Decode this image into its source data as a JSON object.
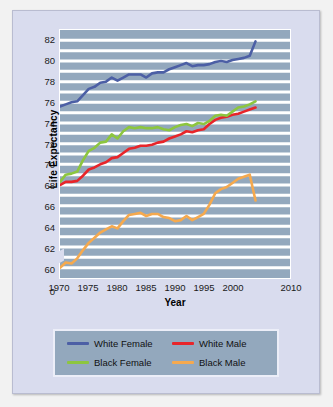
{
  "chart_data": {
    "type": "line",
    "title": "",
    "xlabel": "Year",
    "ylabel": "Life Expectancy",
    "xlim": [
      1970,
      2010
    ],
    "ylim": [
      59,
      83
    ],
    "grid": true,
    "legend_position": "bottom",
    "x_ticks": [
      "1970",
      "1975",
      "1980",
      "1985",
      "1990",
      "1995",
      "2000",
      "2010"
    ],
    "x_tick_values": [
      1970,
      1975,
      1980,
      1985,
      1990,
      1995,
      2000,
      2010
    ],
    "y_ticks": [
      "0",
      "60",
      "62",
      "64",
      "66",
      "68",
      "70",
      "72",
      "74",
      "76",
      "78",
      "80",
      "82"
    ],
    "y_tick_values": [
      59,
      60,
      62,
      64,
      66,
      68,
      70,
      72,
      74,
      76,
      78,
      80,
      82
    ],
    "axis_break_below": 60,
    "x": [
      1970,
      1971,
      1972,
      1973,
      1974,
      1975,
      1976,
      1977,
      1978,
      1979,
      1980,
      1981,
      1982,
      1983,
      1984,
      1985,
      1986,
      1987,
      1988,
      1989,
      1990,
      1991,
      1992,
      1993,
      1994,
      1995,
      1996,
      1997,
      1998,
      1999,
      2000,
      2001,
      2002,
      2003
    ],
    "series": [
      {
        "name": "White Female",
        "color": "#4c5fa5",
        "values": [
          75.6,
          75.8,
          76.0,
          76.1,
          76.7,
          77.3,
          77.5,
          77.9,
          78.0,
          78.4,
          78.1,
          78.4,
          78.7,
          78.7,
          78.7,
          78.4,
          78.8,
          78.9,
          78.9,
          79.2,
          79.4,
          79.6,
          79.8,
          79.5,
          79.6,
          79.6,
          79.7,
          79.9,
          80.0,
          79.9,
          80.1,
          80.2,
          80.3,
          80.5
        ],
        "last_value": 81.9
      },
      {
        "name": "White Male",
        "color": "#e8252a",
        "values": [
          68.0,
          68.3,
          68.3,
          68.4,
          68.9,
          69.5,
          69.7,
          70.0,
          70.2,
          70.6,
          70.7,
          71.1,
          71.5,
          71.6,
          71.8,
          71.8,
          71.9,
          72.1,
          72.2,
          72.5,
          72.7,
          72.9,
          73.2,
          73.1,
          73.3,
          73.4,
          73.9,
          74.3,
          74.5,
          74.6,
          74.8,
          74.9,
          75.1,
          75.3
        ],
        "last_value": 75.5
      },
      {
        "name": "Black Female",
        "color": "#8dc63f",
        "values": [
          68.3,
          69.0,
          69.1,
          69.3,
          70.4,
          71.3,
          71.6,
          72.1,
          72.2,
          72.9,
          72.5,
          73.2,
          73.6,
          73.5,
          73.6,
          73.5,
          73.5,
          73.6,
          73.4,
          73.3,
          73.6,
          73.8,
          73.9,
          73.7,
          74.0,
          73.9,
          74.2,
          74.7,
          74.8,
          74.7,
          75.1,
          75.5,
          75.6,
          75.8
        ],
        "last_value": 76.1
      },
      {
        "name": "Black Male",
        "color": "#f5a94e",
        "values": [
          60.0,
          60.5,
          60.4,
          60.9,
          61.7,
          62.4,
          62.9,
          63.4,
          63.7,
          64.0,
          63.8,
          64.5,
          65.1,
          65.2,
          65.3,
          65.0,
          65.2,
          65.2,
          64.9,
          64.8,
          64.5,
          64.6,
          65.0,
          64.6,
          64.9,
          65.2,
          66.1,
          67.2,
          67.6,
          67.8,
          68.2,
          68.6,
          68.8,
          69.0
        ],
        "last_value": 66.5
      }
    ]
  },
  "legend": {
    "items": [
      {
        "label": "White Female",
        "color": "#4c5fa5"
      },
      {
        "label": "White Male",
        "color": "#e8252a"
      },
      {
        "label": "Black Female",
        "color": "#8dc63f"
      },
      {
        "label": "Black Male",
        "color": "#f5a94e"
      }
    ]
  }
}
